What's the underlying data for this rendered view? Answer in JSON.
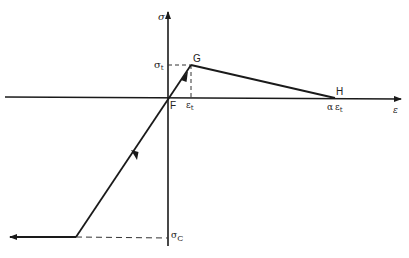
{
  "diagram": {
    "type": "stress-strain constitutive model",
    "axes": {
      "vertical_label": "σ",
      "horizontal_label": "ε"
    },
    "points": {
      "F": {
        "label": "F",
        "x": 168,
        "y": 98
      },
      "G": {
        "label": "G",
        "x": 191,
        "y": 65
      },
      "H": {
        "label": "H",
        "x": 335,
        "y": 98
      },
      "C": {
        "label": "",
        "x": 76,
        "y": 237
      }
    },
    "labels": {
      "sigma_t": "σ",
      "sigma_t_sub": "t",
      "epsilon_t": "ε",
      "epsilon_t_sub": "t",
      "alpha_epsilon_t_alpha": "α",
      "alpha_epsilon_t_eps": "ε",
      "alpha_epsilon_t_sub": "t",
      "sigma_c": "σ",
      "sigma_c_sub": "C",
      "F": "F",
      "G": "G",
      "H": "H",
      "sigma_axis": "σ",
      "epsilon_axis": "ε"
    },
    "colors": {
      "line": "#1a1a1a",
      "dashed": "#333333",
      "background": "#ffffff"
    }
  }
}
